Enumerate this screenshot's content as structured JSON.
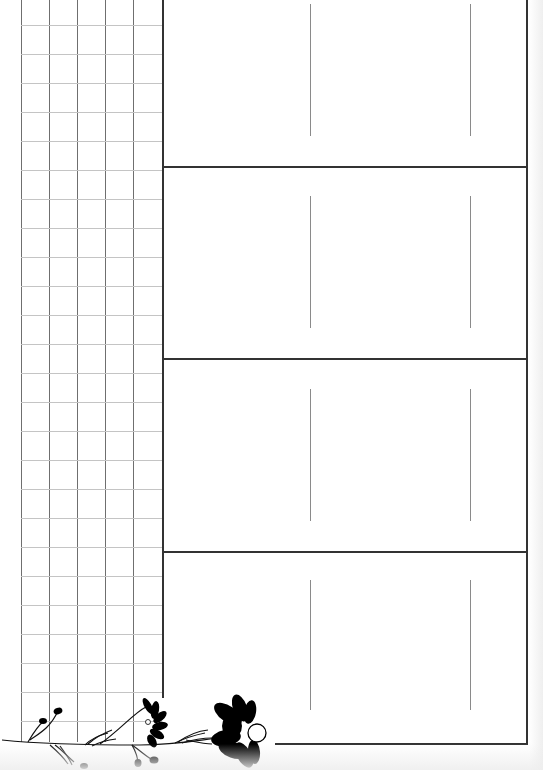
{
  "page": {
    "type": "printable planner template",
    "background_color": "#ffffff",
    "line_color": "#333333",
    "grid_line_color": "#6f6f6f",
    "grid_hline_color": "#c4c4c4"
  },
  "left_grid": {
    "columns_x": [
      21,
      49,
      77,
      105,
      133
    ],
    "row_spacing_px": 29,
    "first_row_y": 25,
    "row_count": 25
  },
  "main_box": {
    "left": 162,
    "right": 526,
    "top": 0,
    "bottom": 743,
    "rows": [
      {
        "top": 0,
        "bottom": 166,
        "inner_lines_y": [
          4,
          136
        ]
      },
      {
        "top": 166,
        "bottom": 358,
        "inner_lines_y": [
          196,
          328
        ]
      },
      {
        "top": 358,
        "bottom": 551,
        "inner_lines_y": [
          389,
          521
        ]
      },
      {
        "top": 551,
        "bottom": 743,
        "inner_lines_y": [
          580,
          710
        ]
      }
    ],
    "inner_lines_x": [
      310,
      470
    ]
  },
  "decoration": {
    "name": "black floral vine",
    "elements": [
      "vine-stem",
      "bud",
      "bud",
      "bud",
      "bud",
      "daisy-flower-small",
      "daisy-flower-large"
    ],
    "color": "#000000"
  }
}
